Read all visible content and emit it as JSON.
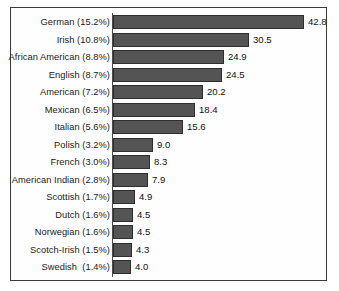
{
  "chart_data": {
    "type": "bar",
    "orientation": "horizontal",
    "title": "",
    "subtitle": "",
    "xlabel": "",
    "ylabel": "",
    "grid": false,
    "legend": null,
    "xlim": [
      0,
      42.8
    ],
    "axis_origin_value": 0,
    "categories": [
      "German (15.2%)",
      "Irish (10.8%)",
      "African American (8.8%)",
      "English (8.7%)",
      "American (7.2%)",
      "Mexican (6.5%)",
      "Italian (5.6%)",
      "Polish (3.2%)",
      "French (3.0%)",
      "American Indian (2.8%)",
      "Scottish (1.7%)",
      "Dutch (1.6%)",
      "Norwegian (1.6%)",
      "Scotch-Irish (1.5%)",
      "Swedish  (1.4%)"
    ],
    "values": [
      42.8,
      30.5,
      24.9,
      24.5,
      20.2,
      18.4,
      15.6,
      9.0,
      8.3,
      7.9,
      4.9,
      4.5,
      4.5,
      4.3,
      4.0
    ],
    "value_labels": [
      "42.8",
      "30.5",
      "24.9",
      "24.5",
      "20.2",
      "18.4",
      "15.6",
      "9.0",
      "8.3",
      "7.9",
      "4.9",
      "4.5",
      "4.5",
      "4.3",
      "4.0"
    ],
    "group_names": [
      "German",
      "Irish",
      "African American",
      "English",
      "American",
      "Mexican",
      "Italian",
      "Polish",
      "French",
      "American Indian",
      "Scottish",
      "Dutch",
      "Norwegian",
      "Scotch-Irish",
      "Swedish"
    ],
    "percent_labels": [
      "15.2%",
      "10.8%",
      "8.8%",
      "8.7%",
      "7.2%",
      "6.5%",
      "5.6%",
      "3.2%",
      "3.0%",
      "2.8%",
      "1.7%",
      "1.6%",
      "1.6%",
      "1.5%",
      "1.4%"
    ],
    "colors": {
      "bar_fill": "#545454",
      "bar_stroke": "#2e2e2e",
      "frame": "#3a3a3a",
      "axis": "#4a4a4a",
      "background": "#fefefe",
      "text": "#1b1b1b"
    }
  }
}
